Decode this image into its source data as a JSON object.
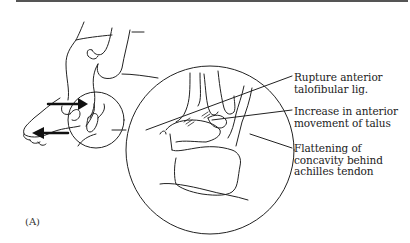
{
  "figure": {
    "panel_label": "(A)",
    "labels": [
      {
        "id": "atfl",
        "lines": [
          "Rupture anterior",
          "talofibular lig."
        ]
      },
      {
        "id": "talus",
        "lines": [
          "Increase in anterior",
          "movement of talus"
        ]
      },
      {
        "id": "achilles",
        "lines": [
          "Flattening of",
          "concavity behind",
          "achilles tendon"
        ]
      }
    ],
    "icons": [
      "arrow-right-icon",
      "arrow-left-icon",
      "magnifier-circle-icon"
    ],
    "colors": {
      "line": "#222222",
      "bar": "#555555",
      "background": "#ffffff"
    }
  }
}
